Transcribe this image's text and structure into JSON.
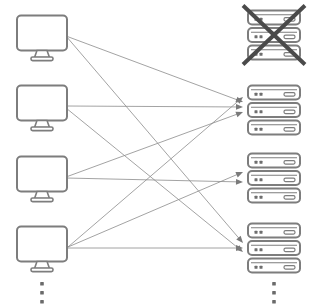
{
  "diagram": {
    "type": "bipartite-network",
    "colors": {
      "device_outline": "#7d7d7d",
      "device_outline_dark": "#6e6e6e",
      "device_fill": "#ffffff",
      "edge_stroke": "#8c8c8c",
      "arrow_fill": "#7a7a7a",
      "cross_stroke": "#4a4a4a",
      "ellipsis_fill": "#6b6b6b",
      "background": "#ffffff"
    },
    "stroke_widths": {
      "device_outline": 2,
      "edge": 0.8,
      "cross": 4
    }
  },
  "clients": {
    "icon_name": "monitor-icon",
    "count_visible": 4,
    "continues": true,
    "items": [
      {
        "id": "client-1",
        "label": "Client 1",
        "x": 42,
        "y": 36,
        "anchor_x": 66,
        "anchor_y": 36
      },
      {
        "id": "client-2",
        "label": "Client 2",
        "x": 42,
        "y": 106,
        "anchor_x": 66,
        "anchor_y": 107
      },
      {
        "id": "client-3",
        "label": "Client 3",
        "x": 42,
        "y": 177,
        "anchor_x": 66,
        "anchor_y": 177
      },
      {
        "id": "client-4",
        "label": "Client 4",
        "x": 42,
        "y": 247,
        "anchor_x": 68,
        "anchor_y": 247
      }
    ],
    "ellipsis": {
      "name": "clients-ellipsis",
      "x": 42,
      "dots": 3,
      "y_start": 282,
      "spacing": 9
    }
  },
  "servers": {
    "icon_name": "server-rack-icon",
    "count_visible": 4,
    "continues": true,
    "units_per_rack": 3,
    "items": [
      {
        "id": "server-1",
        "label": "Server 1",
        "x": 274,
        "y": 35,
        "status": "offline",
        "crossed_out": true,
        "incoming": 0
      },
      {
        "id": "server-2",
        "label": "Server 2",
        "x": 274,
        "y": 110,
        "status": "online",
        "crossed_out": false,
        "incoming": 4
      },
      {
        "id": "server-3",
        "label": "Server 3",
        "x": 274,
        "y": 178,
        "status": "online",
        "crossed_out": false,
        "incoming": 2
      },
      {
        "id": "server-4",
        "label": "Server 4",
        "x": 274,
        "y": 248,
        "status": "online",
        "crossed_out": false,
        "incoming": 3
      }
    ],
    "ellipsis": {
      "name": "servers-ellipsis",
      "x": 274,
      "dots": 3,
      "y_start": 282,
      "spacing": 9
    }
  },
  "edges": [
    {
      "id": "edge-c1-s2",
      "from": "client-1",
      "to": "server-2",
      "x1": 66,
      "y1": 36,
      "x2": 243,
      "y2": 102
    },
    {
      "id": "edge-c1-s4",
      "from": "client-1",
      "to": "server-4",
      "x1": 66,
      "y1": 36,
      "x2": 243,
      "y2": 243
    },
    {
      "id": "edge-c2-s2",
      "from": "client-2",
      "to": "server-2",
      "x1": 66,
      "y1": 106,
      "x2": 243,
      "y2": 107
    },
    {
      "id": "edge-c2-s4",
      "from": "client-2",
      "to": "server-4",
      "x1": 66,
      "y1": 108,
      "x2": 243,
      "y2": 252
    },
    {
      "id": "edge-c3-s2",
      "from": "client-3",
      "to": "server-2",
      "x1": 66,
      "y1": 177,
      "x2": 243,
      "y2": 112
    },
    {
      "id": "edge-c3-s3",
      "from": "client-3",
      "to": "server-3",
      "x1": 66,
      "y1": 178,
      "x2": 243,
      "y2": 182
    },
    {
      "id": "edge-c4-s2",
      "from": "client-4",
      "to": "server-2",
      "x1": 68,
      "y1": 247,
      "x2": 243,
      "y2": 97
    },
    {
      "id": "edge-c4-s3",
      "from": "client-4",
      "to": "server-3",
      "x1": 68,
      "y1": 247,
      "x2": 243,
      "y2": 172
    },
    {
      "id": "edge-c4-s4",
      "from": "client-4",
      "to": "server-4",
      "x1": 68,
      "y1": 248,
      "x2": 243,
      "y2": 248
    }
  ]
}
